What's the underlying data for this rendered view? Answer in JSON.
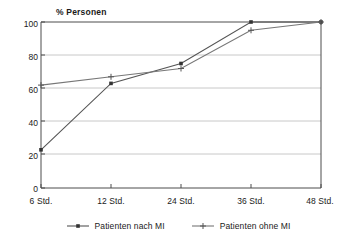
{
  "chart_data": {
    "type": "line",
    "title": "",
    "ylabel": "% Personen",
    "xlabel": "",
    "categories": [
      "6 Std.",
      "12 Std.",
      "24 Std.",
      "36 Std.",
      "48 Std."
    ],
    "x": [
      6,
      12,
      24,
      36,
      48
    ],
    "ylim": [
      0,
      100
    ],
    "yticks": [
      0,
      20,
      40,
      60,
      80,
      100
    ],
    "grid": true,
    "legend_position": "bottom",
    "series": [
      {
        "name": "Patienten nach MI",
        "values": [
          23,
          63,
          75,
          100,
          100
        ],
        "color": "#555555",
        "marker": "square"
      },
      {
        "name": "Patienten ohne MI",
        "values": [
          62,
          67,
          72,
          95,
          100
        ],
        "color": "#777777",
        "marker": "plus"
      }
    ]
  },
  "axes": {
    "ytick_labels": [
      "100",
      "80",
      "60",
      "40",
      "20",
      "0"
    ],
    "xtick_labels": [
      "6 Std.",
      "12 Std.",
      "24 Std.",
      "36 Std.",
      "48 Std."
    ]
  },
  "legend": {
    "entries": [
      {
        "label": "Patienten nach MI"
      },
      {
        "label": "Patienten ohne MI"
      }
    ]
  },
  "colors": {
    "axis": "#4d4d4d",
    "grid": "#c8c8c8",
    "series_a": "#555555",
    "series_b": "#777777",
    "text": "#1a1a1a",
    "background": "#ffffff"
  }
}
